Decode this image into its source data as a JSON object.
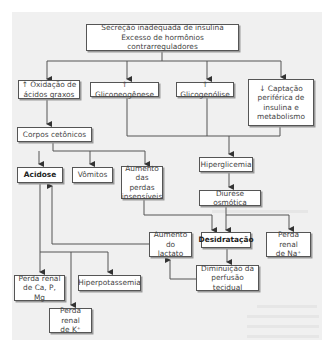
{
  "diagram": {
    "nodes": {
      "root": "Secreção inadequada de insulina\nExcesso de hormônios contrarreguladores",
      "oxidacao": "↑ Oxidação de\nácidos graxos",
      "gliconeogenese": "↑ Gliconeogênese",
      "glicogenolise": "↑ Glicogenólise",
      "captacao": "↓ Captação\nperiférica de\ninsulina e\nmetabolismo",
      "corpos": "Corpos cetônicos",
      "hiperglicemia": "Hiperglicemia",
      "diurese": "Diurese osmótica",
      "acidose": "Acidose",
      "vomitos": "Vômitos",
      "perdas_insensiveis": "Aumento\ndas perdas\ninsensíveis",
      "lactato": "Aumento\ndo lactato",
      "desidratacao": "Desidratação",
      "perda_na": "Perda renal\nde Na⁺",
      "perfusao": "Diminuição da\nperfusão tecidual",
      "perda_ca": "Perda renal\nde Ca, P, Mg",
      "hiperpotassemia": "Hiperpotassemia",
      "perda_k": "Perda renal\nde K⁺"
    },
    "edges": [
      [
        "root",
        "oxidacao"
      ],
      [
        "root",
        "gliconeogenese"
      ],
      [
        "root",
        "glicogenolise"
      ],
      [
        "root",
        "captacao"
      ],
      [
        "oxidacao",
        "corpos"
      ],
      [
        "gliconeogenese",
        "hiperglicemia"
      ],
      [
        "glicogenolise",
        "hiperglicemia"
      ],
      [
        "captacao",
        "hiperglicemia"
      ],
      [
        "corpos",
        "acidose"
      ],
      [
        "corpos",
        "vomitos"
      ],
      [
        "corpos",
        "perdas_insensiveis"
      ],
      [
        "hiperglicemia",
        "diurese"
      ],
      [
        "diurese",
        "desidratacao"
      ],
      [
        "diurese",
        "perda_na"
      ],
      [
        "perdas_insensiveis",
        "desidratacao"
      ],
      [
        "desidratacao",
        "perfusao"
      ],
      [
        "perfusao",
        "lactato"
      ],
      [
        "lactato",
        "acidose"
      ],
      [
        "acidose",
        "perda_ca"
      ],
      [
        "acidose",
        "hiperpotassemia"
      ],
      [
        "acidose",
        "perda_k"
      ]
    ],
    "colors": {
      "box_border": "#555555",
      "line": "#444444",
      "panel": "#f0f0f0"
    }
  }
}
